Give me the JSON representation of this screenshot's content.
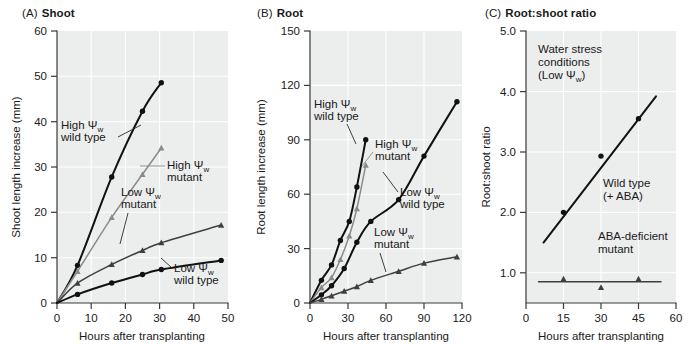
{
  "figure": {
    "xlabel": "Hours after transplanting",
    "panels": [
      {
        "tag": "(A)",
        "name": "Shoot",
        "ylabel": "Shoot length increase (mm)",
        "xlabel": "Hours after transplanting",
        "xticks": [
          0,
          10,
          20,
          30,
          40,
          50
        ],
        "yticks": [
          0,
          10,
          20,
          30,
          40,
          50,
          60
        ],
        "xlim": [
          0,
          50
        ],
        "ylim": [
          0,
          60
        ],
        "annotations": [
          {
            "id": "high-wt",
            "lines": [
              "High Ψ",
              "wild type"
            ],
            "sub": "w"
          },
          {
            "id": "high-mut",
            "lines": [
              "High Ψ",
              "mutant"
            ],
            "sub": "w"
          },
          {
            "id": "low-mut",
            "lines": [
              "Low Ψ",
              "mutant"
            ],
            "sub": "w"
          },
          {
            "id": "low-wt",
            "lines": [
              "Low Ψ",
              "wild type"
            ],
            "sub": "w"
          }
        ]
      },
      {
        "tag": "(B)",
        "name": "Root",
        "ylabel": "Root length increase (mm)",
        "xlabel": "Hours after transplanting",
        "xticks": [
          0,
          30,
          60,
          90,
          120
        ],
        "yticks": [
          0,
          30,
          60,
          90,
          120,
          150
        ],
        "xlim": [
          0,
          120
        ],
        "ylim": [
          0,
          150
        ],
        "annotations": [
          {
            "id": "high-wt",
            "lines": [
              "High Ψ",
              "wild type"
            ],
            "sub": "w"
          },
          {
            "id": "high-mut",
            "lines": [
              "High Ψ",
              "mutant"
            ],
            "sub": "w"
          },
          {
            "id": "low-wt",
            "lines": [
              "Low Ψ",
              "wild type"
            ],
            "sub": "w"
          },
          {
            "id": "low-mut",
            "lines": [
              "Low Ψ",
              "mutant"
            ],
            "sub": "w"
          }
        ]
      },
      {
        "tag": "(C)",
        "name": "Root:shoot ratio",
        "ylabel": "Root:shoot ratio",
        "xlabel": "Hours after transplanting",
        "xticks": [
          0,
          15,
          30,
          45,
          60
        ],
        "yticks": [
          "1.0",
          "2.0",
          "3.0",
          "4.0",
          "5.0"
        ],
        "xlim": [
          0,
          60
        ],
        "ylim": [
          0.5,
          5.0
        ],
        "annotations": [
          {
            "id": "condition",
            "lines": [
              "Water stress",
              "conditions",
              "(Low Ψ",
              ")"
            ],
            "sub": "w"
          },
          {
            "id": "wild-type",
            "lines": [
              "Wild type",
              "(+ ABA)"
            ]
          },
          {
            "id": "aba-mutant",
            "lines": [
              "ABA-deficient",
              "mutant"
            ]
          }
        ]
      }
    ]
  },
  "chart_data": [
    {
      "panel": "(A)",
      "type": "line",
      "title": "Shoot",
      "xlabel": "Hours after transplanting",
      "ylabel": "Shoot length increase (mm)",
      "xlim": [
        0,
        50
      ],
      "ylim": [
        0,
        60
      ],
      "xticks": [
        0,
        10,
        20,
        30,
        40,
        50
      ],
      "yticks": [
        0,
        10,
        20,
        30,
        40,
        50,
        60
      ],
      "grid": true,
      "legend": "inline-annotations",
      "series": [
        {
          "name": "High Ψw wild type",
          "marker": "circle",
          "color": "#111111",
          "x": [
            0,
            6,
            16,
            25,
            30.5
          ],
          "y": [
            0,
            8.3,
            27.8,
            42.3,
            48.6
          ]
        },
        {
          "name": "High Ψw mutant",
          "marker": "triangle",
          "color": "#8b8b8b",
          "x": [
            0,
            6,
            16,
            25,
            30.5
          ],
          "y": [
            0,
            7.0,
            18.9,
            28.4,
            34.2
          ]
        },
        {
          "name": "Low Ψw mutant",
          "marker": "triangle",
          "color": "#3f3f3f",
          "x": [
            0,
            6,
            16,
            25,
            30.5,
            48
          ],
          "y": [
            0,
            4.4,
            8.5,
            11.6,
            13.3,
            17.2
          ]
        },
        {
          "name": "Low Ψw wild type",
          "marker": "circle",
          "color": "#111111",
          "x": [
            0,
            6,
            16,
            25,
            30.5,
            48
          ],
          "y": [
            0,
            1.9,
            4.4,
            6.3,
            7.4,
            9.4
          ]
        }
      ]
    },
    {
      "panel": "(B)",
      "type": "line",
      "title": "Root",
      "xlabel": "Hours after transplanting",
      "ylabel": "Root length increase (mm)",
      "xlim": [
        0,
        120
      ],
      "ylim": [
        0,
        150
      ],
      "xticks": [
        0,
        30,
        60,
        90,
        120
      ],
      "yticks": [
        0,
        30,
        60,
        90,
        120,
        150
      ],
      "grid": true,
      "legend": "inline-annotations",
      "series": [
        {
          "name": "High Ψw wild type",
          "marker": "circle",
          "color": "#111111",
          "x": [
            0,
            9,
            17,
            24,
            31,
            37,
            44
          ],
          "y": [
            0,
            12.5,
            21,
            34.5,
            45,
            64,
            90
          ]
        },
        {
          "name": "High Ψw mutant",
          "marker": "triangle",
          "color": "#8b8b8b",
          "x": [
            0,
            9,
            17,
            24,
            31,
            37,
            44
          ],
          "y": [
            0,
            8.5,
            14,
            24,
            37,
            52,
            76
          ]
        },
        {
          "name": "Low Ψw wild type",
          "marker": "circle",
          "color": "#111111",
          "x": [
            0,
            9,
            17,
            27,
            37,
            48,
            70,
            90,
            116
          ],
          "y": [
            0,
            4.5,
            9.5,
            19,
            33.5,
            45,
            57,
            81,
            111
          ]
        },
        {
          "name": "Low Ψw mutant",
          "marker": "triangle",
          "color": "#3f3f3f",
          "x": [
            0,
            9,
            17,
            27,
            37,
            48,
            70,
            90,
            116
          ],
          "y": [
            0,
            2.0,
            4.0,
            6.5,
            9.0,
            12.5,
            17.5,
            22.0,
            25.5
          ]
        }
      ]
    },
    {
      "panel": "(C)",
      "type": "scatter",
      "title": "Root:shoot ratio",
      "xlabel": "Hours after transplanting",
      "ylabel": "Root:shoot ratio",
      "xlim": [
        0,
        60
      ],
      "ylim": [
        0.5,
        5.0
      ],
      "xticks": [
        0,
        15,
        30,
        45,
        60
      ],
      "yticks": [
        1.0,
        2.0,
        3.0,
        4.0,
        5.0
      ],
      "grid": true,
      "legend": "inline-annotations",
      "series": [
        {
          "name": "Wild type (+ ABA)",
          "marker": "circle",
          "color": "#111111",
          "x": [
            15,
            30,
            45
          ],
          "y": [
            2.0,
            2.93,
            3.55
          ],
          "fit_line": {
            "x": [
              7,
              52
            ],
            "y": [
              1.5,
              3.92
            ]
          }
        },
        {
          "name": "ABA-deficient mutant",
          "marker": "triangle",
          "color": "#3f3f3f",
          "x": [
            15,
            30,
            45
          ],
          "y": [
            0.9,
            0.76,
            0.9
          ],
          "fit_line": {
            "x": [
              5,
              54
            ],
            "y": [
              0.85,
              0.85
            ]
          }
        }
      ]
    }
  ]
}
